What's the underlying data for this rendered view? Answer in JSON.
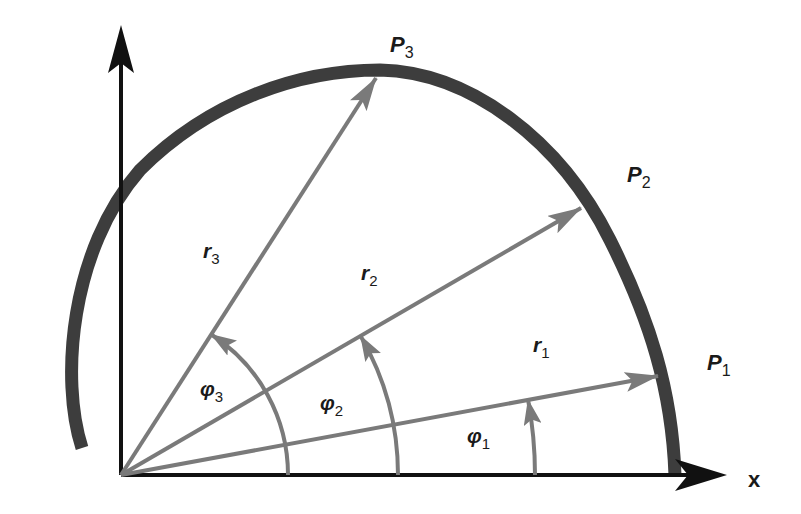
{
  "diagram": {
    "axes": {
      "x_label": "x",
      "origin": [
        121,
        475
      ],
      "x_end": [
        727,
        475
      ],
      "y_end": [
        121,
        25
      ]
    },
    "colors": {
      "axis": "#111111",
      "curve": "#3d3d3d",
      "vector": "#7a7a7a",
      "label": "#1a1a1a"
    },
    "points": [
      {
        "name": "P",
        "sub": "1",
        "tip": [
          658,
          376
        ],
        "label_pos": [
          707,
          370
        ]
      },
      {
        "name": "P",
        "sub": "2",
        "tip": [
          581,
          208
        ],
        "label_pos": [
          627,
          182
        ]
      },
      {
        "name": "P",
        "sub": "3",
        "tip": [
          376,
          78
        ],
        "label_pos": [
          390,
          52
        ]
      }
    ],
    "radii": [
      {
        "name": "r",
        "sub": "1",
        "label_pos": [
          533,
          352
        ]
      },
      {
        "name": "r",
        "sub": "2",
        "label_pos": [
          361,
          280
        ]
      },
      {
        "name": "r",
        "sub": "3",
        "label_pos": [
          203,
          258
        ]
      }
    ],
    "angles": [
      {
        "name": "φ",
        "sub": "1",
        "radius": 414,
        "label_pos": [
          467,
          443
        ]
      },
      {
        "name": "φ",
        "sub": "2",
        "radius": 277,
        "label_pos": [
          320,
          410
        ]
      },
      {
        "name": "φ",
        "sub": "3",
        "radius": 167,
        "label_pos": [
          200,
          396
        ]
      }
    ]
  }
}
